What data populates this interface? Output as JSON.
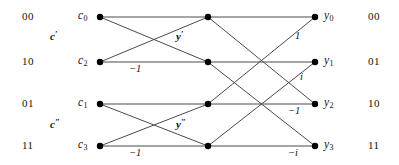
{
  "figure": {
    "type": "butterfly-diagram",
    "stroke_color": "#4a4a4a",
    "node_color": "#000000",
    "text_color": "#111111"
  },
  "columns": {
    "input_index": {
      "name": "input-bit-labels",
      "values": [
        "00",
        "10",
        "01",
        "11"
      ]
    },
    "output_index": {
      "name": "output-bit-labels",
      "values": [
        "00",
        "01",
        "10",
        "11"
      ]
    }
  },
  "nodes": {
    "input": [
      {
        "id": "c0",
        "base": "c",
        "sub": "0",
        "x": 100,
        "y": 17
      },
      {
        "id": "c2",
        "base": "c",
        "sub": "2",
        "x": 100,
        "y": 62
      },
      {
        "id": "c1",
        "base": "c",
        "sub": "1",
        "x": 100,
        "y": 104
      },
      {
        "id": "c3",
        "base": "c",
        "sub": "3",
        "x": 100,
        "y": 146
      }
    ],
    "middle": [
      {
        "id": "m0",
        "x": 208,
        "y": 17
      },
      {
        "id": "m1",
        "x": 208,
        "y": 62
      },
      {
        "id": "m2",
        "x": 208,
        "y": 104
      },
      {
        "id": "m3",
        "x": 208,
        "y": 146
      }
    ],
    "output": [
      {
        "id": "y0",
        "base": "y",
        "sub": "0",
        "x": 315,
        "y": 17
      },
      {
        "id": "y1",
        "base": "y",
        "sub": "1",
        "x": 315,
        "y": 62
      },
      {
        "id": "y2",
        "base": "y",
        "sub": "2",
        "x": 315,
        "y": 104
      },
      {
        "id": "y3",
        "base": "y",
        "sub": "3",
        "x": 315,
        "y": 146
      }
    ]
  },
  "group_labels": [
    {
      "id": "c-prime",
      "base": "c",
      "prime": "′",
      "x": 56,
      "y": 36
    },
    {
      "id": "c-dprime",
      "base": "c",
      "prime": "″",
      "x": 56,
      "y": 124
    },
    {
      "id": "y-prime",
      "base": "y",
      "prime": "′",
      "x": 180,
      "y": 36
    },
    {
      "id": "y-dprime",
      "base": "y",
      "prime": "″",
      "x": 180,
      "y": 124
    }
  ],
  "edge_weights": [
    {
      "id": "w-stage1-c2",
      "text": "−1",
      "x": 135,
      "y": 69
    },
    {
      "id": "w-stage1-c3",
      "text": "−1",
      "x": 135,
      "y": 153
    },
    {
      "id": "w-stage2-y0",
      "text": "1",
      "x": 297,
      "y": 36
    },
    {
      "id": "w-stage2-y1",
      "text": "i",
      "x": 301,
      "y": 77
    },
    {
      "id": "w-stage2-y2",
      "text": "−1",
      "x": 292,
      "y": 111
    },
    {
      "id": "w-stage2-y3",
      "text": "−i",
      "x": 292,
      "y": 153
    }
  ],
  "edges": {
    "stage1": [
      {
        "from": "c0",
        "to": "m0",
        "kind": "horizontal"
      },
      {
        "from": "c0",
        "to": "m1",
        "kind": "diagonal"
      },
      {
        "from": "c2",
        "to": "m1",
        "kind": "horizontal"
      },
      {
        "from": "c2",
        "to": "m0",
        "kind": "diagonal"
      },
      {
        "from": "c1",
        "to": "m2",
        "kind": "horizontal"
      },
      {
        "from": "c1",
        "to": "m3",
        "kind": "diagonal"
      },
      {
        "from": "c3",
        "to": "m3",
        "kind": "horizontal"
      },
      {
        "from": "c3",
        "to": "m2",
        "kind": "diagonal"
      }
    ],
    "stage2": [
      {
        "from": "m0",
        "to": "y0",
        "kind": "horizontal"
      },
      {
        "from": "m0",
        "to": "y2",
        "kind": "diagonal"
      },
      {
        "from": "m1",
        "to": "y1",
        "kind": "horizontal"
      },
      {
        "from": "m1",
        "to": "y3",
        "kind": "diagonal"
      },
      {
        "from": "m2",
        "to": "y0",
        "kind": "diagonal"
      },
      {
        "from": "m2",
        "to": "y2",
        "kind": "horizontal"
      },
      {
        "from": "m3",
        "to": "y1",
        "kind": "diagonal"
      },
      {
        "from": "m3",
        "to": "y3",
        "kind": "horizontal"
      }
    ]
  }
}
